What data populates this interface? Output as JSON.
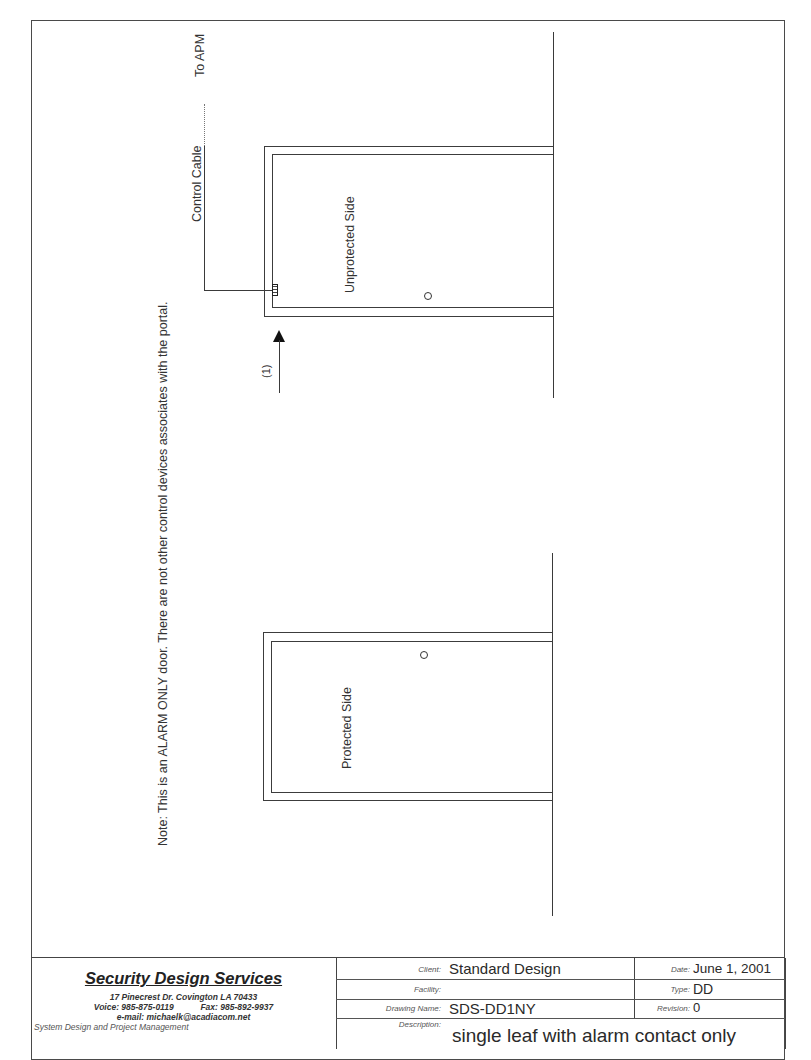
{
  "drawing": {
    "note": "Note:  This is an ALARM ONLY door.  There are not other control devices associates with the portal.",
    "labels": {
      "to_apm": "To APM",
      "control_cable": "Control Cable",
      "unprotected_side": "Unprotected Side",
      "protected_side": "Protected Side",
      "device_callout": "(1)"
    },
    "icons": {
      "door_contact": "circle-contact-icon",
      "cable_contact_box": "alarm-contact-box-icon",
      "callout_arrow": "arrow-up-icon"
    },
    "line_color": "#3a3a3a"
  },
  "title_block": {
    "company": {
      "name": "Security Design Services",
      "address": "17 Pinecrest Dr.  Covington LA 70433",
      "voice": "Voice: 985-875-0119",
      "fax": "Fax: 985-892-9937",
      "email": "e-mail: michaelk@acadiacom.net",
      "tagline": "System Design and Project Management"
    },
    "fields": {
      "client_label": "Client:",
      "client": "Standard Design",
      "facility_label": "Facility:",
      "facility": "",
      "drawing_name_label": "Drawing Name:",
      "drawing_name": "SDS-DD1NY",
      "description_label": "Description:",
      "description": "single leaf with alarm contact only",
      "date_label": "Date:",
      "date": "June 1, 2001",
      "type_label": "Type:",
      "type": "DD",
      "revision_label": "Revision:",
      "revision": "0"
    }
  }
}
